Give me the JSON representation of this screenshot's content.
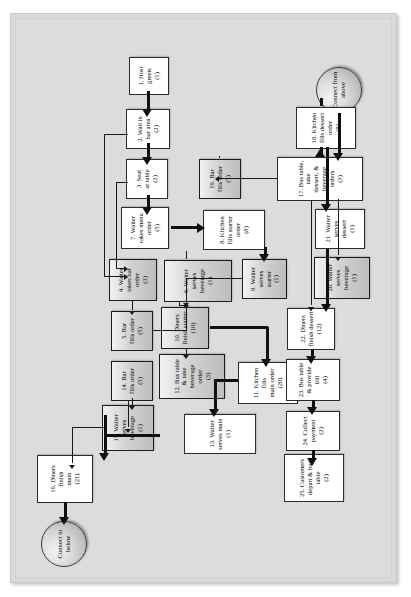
{
  "diagram": {
    "orientation": "rotated-90-ccw",
    "colors": {
      "page_background": "#ffffff",
      "canvas_background": "#dcdcdc",
      "node_fill": "#ffffff",
      "node_shaded_fill": "#cfcfcf",
      "border": "#2b2b2b",
      "connector": "#1a1a1a"
    },
    "terminators": [
      {
        "id": "t_below",
        "label": "Connect to below",
        "lines": [
          "Connect",
          "to below"
        ]
      },
      {
        "id": "t_above",
        "label": "Connect from above",
        "lines": [
          "Connect",
          "from",
          "above"
        ]
      }
    ],
    "nodes": [
      {
        "id": "n1",
        "num": "1.",
        "lines": [
          "1. Host",
          "greets",
          "(1)"
        ],
        "text": "1. Host greets (1)",
        "duration": "1",
        "shaded": false
      },
      {
        "id": "n2",
        "num": "2.",
        "lines": [
          "2. Wait in",
          "bar area",
          "(2)"
        ],
        "text": "2. Wait in bar area (2)",
        "duration": "2",
        "shaded": false
      },
      {
        "id": "n3",
        "num": "3.",
        "lines": [
          "3. Seat",
          "at table",
          "(2)"
        ],
        "text": "3. Seat at table (2)",
        "duration": "2",
        "shaded": false
      },
      {
        "id": "n4",
        "num": "4.",
        "lines": [
          "4. Waiter",
          "takes bar",
          "order",
          "(3)"
        ],
        "text": "4. Waiter takes bar order (3)",
        "duration": "3",
        "shaded": true
      },
      {
        "id": "n5",
        "num": "5.",
        "lines": [
          "5. Bar",
          "fills order",
          "(5)"
        ],
        "text": "5. Bar fills order (5)",
        "duration": "5",
        "shaded": true
      },
      {
        "id": "n6",
        "num": "6.",
        "lines": [
          "6. Waiter serves beverage",
          "(1)"
        ],
        "text": "6. Waiter serves beverage (1)",
        "duration": "1",
        "shaded": true
      },
      {
        "id": "n7",
        "num": "7.",
        "lines": [
          "7. Waiter",
          "takes menu",
          "order",
          "(5)"
        ],
        "text": "7. Waiter takes menu order (5)",
        "duration": "5",
        "shaded": false
      },
      {
        "id": "n8",
        "num": "8.",
        "lines": [
          "8. Kitchen",
          "fills starter order",
          "(8)"
        ],
        "text": "8. Kitchen fills starter order (8)",
        "duration": "8",
        "shaded": false
      },
      {
        "id": "n9",
        "num": "9.",
        "lines": [
          "9. Waiter",
          "serves starter",
          "(1)"
        ],
        "text": "9. Waiter serves starter (1)",
        "duration": "1",
        "shaded": true
      },
      {
        "id": "n10",
        "num": "10.",
        "lines": [
          "10. Diners",
          "finish starter",
          "(10)"
        ],
        "text": "10. Diners finish starter (10)",
        "duration": "10",
        "shaded": true
      },
      {
        "id": "n11",
        "num": "11.",
        "lines": [
          "11. Kitchen fills",
          "main order",
          "(20)"
        ],
        "text": "11. Kitchen fills main order (20)",
        "duration": "20",
        "shaded": false
      },
      {
        "id": "n12",
        "num": "12.",
        "lines": [
          "12. Bus table & take",
          "beverage order",
          "(3)"
        ],
        "text": "12. Bus table & take beverage order (3)",
        "duration": "3",
        "shaded": true
      },
      {
        "id": "n13",
        "num": "13.",
        "lines": [
          "13. Waiter serves main",
          "(1)"
        ],
        "text": "13. Waiter serves main (1)",
        "duration": "1",
        "shaded": false
      },
      {
        "id": "n14",
        "num": "14.",
        "lines": [
          "14. Bar",
          "fills order",
          "(5)"
        ],
        "text": "14. Bar fills order (5)",
        "duration": "5",
        "shaded": true
      },
      {
        "id": "n15",
        "num": "15.",
        "lines": [
          "15. Waiter",
          "serves",
          "beverage",
          "(1)"
        ],
        "text": "15. Waiter serves beverage (1)",
        "duration": "1",
        "shaded": true
      },
      {
        "id": "n16",
        "num": "16.",
        "lines": [
          "16. Diners",
          "finish",
          "main",
          "(21)"
        ],
        "text": "16. Diners finish main (21)",
        "duration": "21",
        "shaded": false
      },
      {
        "id": "n17",
        "num": "17.",
        "lines": [
          "17. Bus table, take",
          "dessert, & beverage orders",
          "(3)"
        ],
        "text": "17. Bus table, take dessert, & beverage orders (3)",
        "duration": "3",
        "shaded": false
      },
      {
        "id": "n18",
        "num": "18.",
        "lines": [
          "18. Kitchen",
          "fills dessert order",
          "(8)"
        ],
        "text": "18. Kitchen fills dessert order (8)",
        "duration": "8",
        "shaded": false
      },
      {
        "id": "n19",
        "num": "19.",
        "lines": [
          "19. Bar",
          "fills order",
          "(5)"
        ],
        "text": "19. Bar fills order (5)",
        "duration": "5",
        "shaded": true
      },
      {
        "id": "n20",
        "num": "20.",
        "lines": [
          "20. Waiter serves",
          "beverage",
          "(1)"
        ],
        "text": "20. Waiter serves beverage (1)",
        "duration": "1",
        "shaded": true
      },
      {
        "id": "n21",
        "num": "21.",
        "lines": [
          "21. Waiter",
          "serves dessert",
          "(1)"
        ],
        "text": "21. Waiter serves dessert (1)",
        "duration": "1",
        "shaded": false
      },
      {
        "id": "n22",
        "num": "22.",
        "lines": [
          "22. Diners",
          "finish dessert",
          "(12)"
        ],
        "text": "22. Diners finish dessert (12)",
        "duration": "12",
        "shaded": false
      },
      {
        "id": "n23",
        "num": "23.",
        "lines": [
          "23. Bus table",
          "& provide bill",
          "(4)"
        ],
        "text": "23. Bus table & provide bill (4)",
        "duration": "4",
        "shaded": false
      },
      {
        "id": "n24",
        "num": "24.",
        "lines": [
          "24. Collect",
          "payment",
          "(2)"
        ],
        "text": "24. Collect payment (2)",
        "duration": "2",
        "shaded": false
      },
      {
        "id": "n25",
        "num": "25.",
        "lines": [
          "25. Customers",
          "depart & bus table",
          "(2)"
        ],
        "text": "25. Customers depart & bus table (2)",
        "duration": "2",
        "shaded": false
      }
    ],
    "edges": [
      {
        "from": "n1",
        "to": "n2",
        "weight": "thick"
      },
      {
        "from": "n2",
        "to": "n3",
        "weight": "thick"
      },
      {
        "from": "n2",
        "to": "n4",
        "weight": "thin"
      },
      {
        "from": "n3",
        "to": "n4",
        "weight": "thin"
      },
      {
        "from": "n3",
        "to": "n7",
        "weight": "thick"
      },
      {
        "from": "n4",
        "to": "n5",
        "weight": "thin"
      },
      {
        "from": "n5",
        "to": "n6",
        "weight": "thin"
      },
      {
        "from": "n6",
        "to": "n10",
        "weight": "thin"
      },
      {
        "from": "n7",
        "to": "n8",
        "weight": "thick"
      },
      {
        "from": "n8",
        "to": "n9",
        "weight": "thick"
      },
      {
        "from": "n9",
        "to": "n10",
        "weight": "thin"
      },
      {
        "from": "n10",
        "to": "n12",
        "weight": "thin"
      },
      {
        "from": "n10",
        "to": "n11",
        "weight": "thick"
      },
      {
        "from": "n11",
        "to": "n13",
        "weight": "thick"
      },
      {
        "from": "n12",
        "to": "n14",
        "weight": "thin"
      },
      {
        "from": "n12",
        "to": "n16",
        "weight": "thick"
      },
      {
        "from": "n13",
        "to": "n16",
        "weight": "thick"
      },
      {
        "from": "n14",
        "to": "n15",
        "weight": "thin"
      },
      {
        "from": "n15",
        "to": "n16",
        "weight": "thin"
      },
      {
        "from": "n16",
        "to": "t_below",
        "weight": "thick"
      },
      {
        "from": "t_above",
        "to": "n17",
        "weight": "thick"
      },
      {
        "from": "n17",
        "to": "n18",
        "weight": "thick"
      },
      {
        "from": "n17",
        "to": "n19",
        "weight": "thin"
      },
      {
        "from": "n17",
        "to": "n22",
        "weight": "thin"
      },
      {
        "from": "n18",
        "to": "n21",
        "weight": "thick"
      },
      {
        "from": "n19",
        "to": "n20",
        "weight": "thin"
      },
      {
        "from": "n20",
        "to": "n22",
        "weight": "thin"
      },
      {
        "from": "n21",
        "to": "n22",
        "weight": "thick"
      },
      {
        "from": "n22",
        "to": "n23",
        "weight": "thick"
      },
      {
        "from": "n23",
        "to": "n24",
        "weight": "thick"
      },
      {
        "from": "n24",
        "to": "n25",
        "weight": "thick"
      }
    ]
  }
}
